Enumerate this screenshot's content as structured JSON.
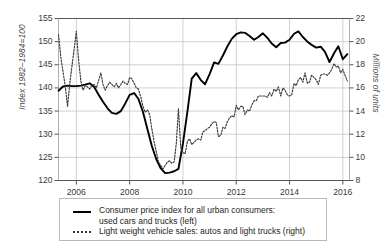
{
  "chart_data": {
    "type": "line",
    "title": "",
    "xlabel": "",
    "ylabel": "Index 1982–1984=100",
    "ylabel_right": "Millions of units",
    "grid": true,
    "legend_position": "bottom",
    "xlim": [
      2005.33,
      2016.25
    ],
    "x_ticks": [
      "2006",
      "2008",
      "2010",
      "2012",
      "2014",
      "2016"
    ],
    "x_tick_values": [
      2006,
      2008,
      2010,
      2012,
      2014,
      2016
    ],
    "ylim": [
      120,
      155
    ],
    "y_ticks": [
      "120",
      "125",
      "130",
      "135",
      "140",
      "145",
      "150",
      "155"
    ],
    "y_tick_values": [
      120,
      125,
      130,
      135,
      140,
      145,
      150,
      155
    ],
    "ylim_right": [
      8,
      22
    ],
    "y_ticks_right": [
      "8",
      "10",
      "12",
      "14",
      "16",
      "18",
      "20",
      "22"
    ],
    "y_tick_values_right": [
      8,
      10,
      12,
      14,
      16,
      18,
      20,
      22
    ],
    "series": [
      {
        "name": "Consumer price index for all urban consumers: used cars and trucks (left)",
        "axis": "left",
        "style": "solid",
        "color": "#000000",
        "x": [
          2005.33,
          2005.5,
          2005.67,
          2005.83,
          2006.0,
          2006.17,
          2006.33,
          2006.5,
          2006.67,
          2006.83,
          2007.0,
          2007.17,
          2007.33,
          2007.5,
          2007.67,
          2007.83,
          2008.0,
          2008.17,
          2008.33,
          2008.5,
          2008.67,
          2008.83,
          2009.0,
          2009.17,
          2009.33,
          2009.5,
          2009.67,
          2009.83,
          2010.0,
          2010.17,
          2010.33,
          2010.5,
          2010.67,
          2010.83,
          2011.0,
          2011.17,
          2011.33,
          2011.5,
          2011.67,
          2011.83,
          2012.0,
          2012.17,
          2012.33,
          2012.5,
          2012.67,
          2012.83,
          2013.0,
          2013.17,
          2013.33,
          2013.5,
          2013.67,
          2013.83,
          2014.0,
          2014.17,
          2014.33,
          2014.5,
          2014.67,
          2014.83,
          2015.0,
          2015.17,
          2015.33,
          2015.5,
          2015.67,
          2015.83,
          2016.0,
          2016.17
        ],
        "y": [
          139.4,
          140.3,
          140.5,
          140.4,
          140.4,
          140.5,
          140.7,
          141.0,
          140.2,
          138.6,
          137.0,
          135.6,
          134.6,
          134.4,
          135.0,
          136.6,
          138.5,
          138.9,
          137.6,
          134.8,
          131.0,
          127.5,
          124.6,
          122.6,
          121.6,
          121.7,
          122.0,
          122.5,
          128.0,
          135.0,
          142.0,
          143.2,
          141.7,
          140.8,
          143.0,
          145.5,
          145.2,
          147.0,
          149.0,
          150.6,
          151.6,
          152.0,
          151.9,
          151.2,
          150.4,
          151.0,
          151.8,
          150.8,
          149.6,
          148.8,
          149.7,
          149.8,
          150.4,
          151.7,
          152.2,
          151.0,
          150.0,
          149.3,
          148.7,
          148.9,
          147.8,
          145.6,
          147.5,
          149.0,
          146.2,
          147.3
        ]
      },
      {
        "name": "Light weight vehicle sales: autos and light trucks (right)",
        "axis": "right",
        "style": "dotted",
        "color": "#3a3a3a",
        "x": [
          2005.33,
          2005.42,
          2005.5,
          2005.58,
          2005.67,
          2005.75,
          2005.83,
          2005.92,
          2006.0,
          2006.08,
          2006.17,
          2006.25,
          2006.33,
          2006.42,
          2006.5,
          2006.58,
          2006.67,
          2006.75,
          2006.83,
          2006.92,
          2007.0,
          2007.08,
          2007.17,
          2007.25,
          2007.33,
          2007.42,
          2007.5,
          2007.58,
          2007.67,
          2007.75,
          2007.83,
          2007.92,
          2008.0,
          2008.08,
          2008.17,
          2008.25,
          2008.33,
          2008.42,
          2008.5,
          2008.58,
          2008.67,
          2008.75,
          2008.83,
          2008.92,
          2009.0,
          2009.08,
          2009.17,
          2009.25,
          2009.33,
          2009.42,
          2009.5,
          2009.58,
          2009.67,
          2009.75,
          2009.83,
          2009.92,
          2010.0,
          2010.08,
          2010.17,
          2010.25,
          2010.33,
          2010.42,
          2010.5,
          2010.58,
          2010.67,
          2010.75,
          2010.83,
          2010.92,
          2011.0,
          2011.08,
          2011.17,
          2011.25,
          2011.33,
          2011.42,
          2011.5,
          2011.58,
          2011.67,
          2011.75,
          2011.83,
          2011.92,
          2012.0,
          2012.08,
          2012.17,
          2012.25,
          2012.33,
          2012.42,
          2012.5,
          2012.58,
          2012.67,
          2012.75,
          2012.83,
          2012.92,
          2013.0,
          2013.08,
          2013.17,
          2013.25,
          2013.33,
          2013.42,
          2013.5,
          2013.58,
          2013.67,
          2013.75,
          2013.83,
          2013.92,
          2014.0,
          2014.08,
          2014.17,
          2014.25,
          2014.33,
          2014.42,
          2014.5,
          2014.58,
          2014.67,
          2014.75,
          2014.83,
          2014.92,
          2015.0,
          2015.08,
          2015.17,
          2015.25,
          2015.33,
          2015.42,
          2015.5,
          2015.58,
          2015.67,
          2015.75,
          2015.83,
          2015.92,
          2016.0,
          2016.08,
          2016.17
        ],
        "y": [
          20.6,
          18.6,
          17.4,
          16.2,
          14.4,
          16.3,
          17.8,
          19.4,
          20.9,
          18.5,
          16.6,
          15.8,
          16.2,
          16.1,
          15.9,
          16.2,
          16.3,
          16.0,
          16.6,
          17.3,
          16.3,
          15.8,
          16.2,
          16.5,
          16.3,
          16.1,
          16.4,
          16.0,
          16.3,
          16.6,
          16.4,
          16.3,
          16.9,
          16.8,
          16.4,
          16.0,
          15.9,
          15.2,
          14.4,
          13.9,
          14.1,
          13.7,
          12.5,
          11.3,
          10.5,
          9.6,
          9.3,
          9.0,
          9.3,
          9.6,
          9.7,
          9.5,
          9.6,
          11.2,
          14.2,
          10.8,
          10.4,
          10.3,
          11.4,
          11.6,
          11.1,
          11.3,
          11.5,
          11.6,
          11.5,
          12.2,
          12.3,
          12.5,
          12.6,
          12.9,
          13.1,
          13.0,
          11.8,
          11.9,
          12.6,
          12.5,
          13.1,
          13.4,
          13.6,
          13.5,
          14.5,
          14.1,
          14.4,
          14.4,
          13.7,
          14.1,
          14.0,
          14.5,
          14.9,
          14.9,
          15.3,
          15.3,
          15.3,
          15.3,
          15.2,
          15.6,
          15.3,
          15.9,
          15.7,
          16.1,
          15.3,
          16.0,
          15.8,
          15.4,
          15.3,
          15.4,
          16.4,
          16.2,
          16.7,
          16.9,
          16.5,
          17.3,
          16.4,
          16.5,
          17.1,
          16.9,
          16.7,
          16.3,
          17.1,
          17.2,
          17.2,
          17.1,
          17.3,
          17.6,
          18.1,
          17.8,
          17.9,
          17.3,
          17.6,
          17.1,
          16.6
        ]
      }
    ]
  },
  "axes": {
    "left": {
      "title": "Index 1982–1984=100",
      "ticks": [
        "155",
        "150",
        "145",
        "140",
        "135",
        "130",
        "125",
        "120"
      ]
    },
    "right": {
      "title": "Millions of units",
      "ticks": [
        "22",
        "20",
        "18",
        "16",
        "14",
        "12",
        "10",
        "8"
      ]
    },
    "x": {
      "ticks": [
        "2006",
        "2008",
        "2010",
        "2012",
        "2014",
        "2016"
      ]
    }
  },
  "legend": {
    "entries": [
      {
        "line1": "Consumer price index for all urban consumers:",
        "line2": "used cars and trucks (left)",
        "swatch": "solid-line-swatch"
      },
      {
        "line1": "Light weight vehicle sales: autos and light trucks (right)",
        "line2": "",
        "swatch": "dotted-line-swatch"
      }
    ]
  }
}
